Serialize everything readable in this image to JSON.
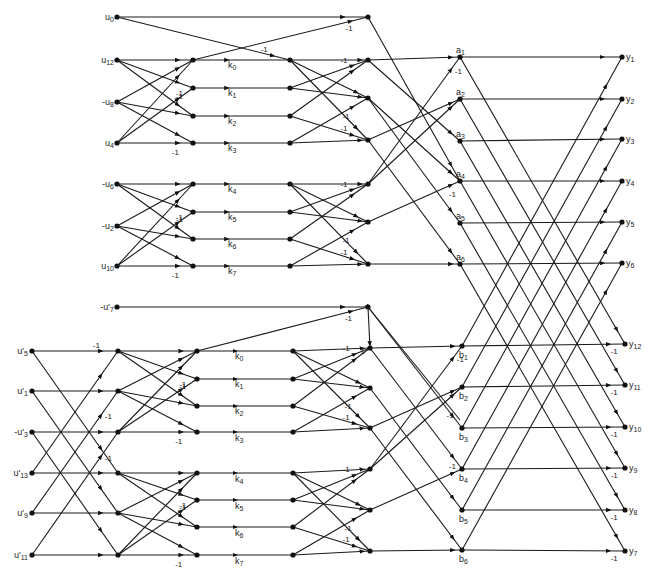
{
  "diagram": {
    "type": "signal-flow-graph",
    "top_inputs": [
      {
        "id": "u0",
        "label": "u",
        "sub": "0",
        "x": 117,
        "y": 17
      },
      {
        "id": "u12",
        "label": "u",
        "sub": "12",
        "x": 117,
        "y": 60
      },
      {
        "id": "mu8",
        "label": "-u",
        "sub": "8",
        "x": 117,
        "y": 102
      },
      {
        "id": "u4",
        "label": "u",
        "sub": "4",
        "x": 117,
        "y": 143
      },
      {
        "id": "mu6",
        "label": "-u",
        "sub": "6",
        "x": 117,
        "y": 184
      },
      {
        "id": "mu2",
        "label": "-u",
        "sub": "2",
        "x": 117,
        "y": 226
      },
      {
        "id": "u10",
        "label": "u",
        "sub": "10",
        "x": 117,
        "y": 266
      },
      {
        "id": "mu7p",
        "label": "-u'",
        "sub": "7",
        "x": 117,
        "y": 307
      }
    ],
    "bottom_inputs": [
      {
        "id": "u5p",
        "label": "u'",
        "sub": "5",
        "x": 32,
        "y": 351
      },
      {
        "id": "u1p",
        "label": "u'",
        "sub": "1",
        "x": 32,
        "y": 391
      },
      {
        "id": "mu3p",
        "label": "-u'",
        "sub": "3",
        "x": 32,
        "y": 432
      },
      {
        "id": "u13p",
        "label": "u'",
        "sub": "13",
        "x": 32,
        "y": 473
      },
      {
        "id": "u9p",
        "label": "u'",
        "sub": "9",
        "x": 32,
        "y": 513
      },
      {
        "id": "u11p",
        "label": "u'",
        "sub": "11",
        "x": 32,
        "y": 555
      }
    ],
    "k_labels_top": [
      {
        "text": "k",
        "sub": "0",
        "x": 228,
        "y": 68
      },
      {
        "text": "k",
        "sub": "1",
        "x": 228,
        "y": 96
      },
      {
        "text": "k",
        "sub": "2",
        "x": 228,
        "y": 124
      },
      {
        "text": "k",
        "sub": "3",
        "x": 228,
        "y": 151
      },
      {
        "text": "k",
        "sub": "4",
        "x": 228,
        "y": 192
      },
      {
        "text": "k",
        "sub": "5",
        "x": 228,
        "y": 220
      },
      {
        "text": "k",
        "sub": "6",
        "x": 228,
        "y": 247
      },
      {
        "text": "k",
        "sub": "7",
        "x": 228,
        "y": 274
      }
    ],
    "k_labels_bottom": [
      {
        "text": "k",
        "sub": "0",
        "x": 235,
        "y": 359
      },
      {
        "text": "k",
        "sub": "1",
        "x": 235,
        "y": 387
      },
      {
        "text": "k",
        "sub": "2",
        "x": 235,
        "y": 414
      },
      {
        "text": "k",
        "sub": "3",
        "x": 235,
        "y": 441
      },
      {
        "text": "k",
        "sub": "4",
        "x": 235,
        "y": 482
      },
      {
        "text": "k",
        "sub": "5",
        "x": 235,
        "y": 509
      },
      {
        "text": "k",
        "sub": "6",
        "x": 235,
        "y": 536
      },
      {
        "text": "k",
        "sub": "7",
        "x": 235,
        "y": 564
      }
    ],
    "a_nodes": [
      {
        "text": "a",
        "sub": "1",
        "x": 460,
        "y": 57
      },
      {
        "text": "a",
        "sub": "2",
        "x": 460,
        "y": 99
      },
      {
        "text": "a",
        "sub": "3",
        "x": 460,
        "y": 141
      },
      {
        "text": "a",
        "sub": "4",
        "x": 460,
        "y": 181
      },
      {
        "text": "a",
        "sub": "5",
        "x": 460,
        "y": 223
      },
      {
        "text": "a",
        "sub": "6",
        "x": 460,
        "y": 264
      }
    ],
    "b_nodes": [
      {
        "text": "b",
        "sub": "1",
        "x": 462,
        "y": 346
      },
      {
        "text": "b",
        "sub": "2",
        "x": 462,
        "y": 387
      },
      {
        "text": "b",
        "sub": "3",
        "x": 462,
        "y": 428
      },
      {
        "text": "b",
        "sub": "4",
        "x": 462,
        "y": 469
      },
      {
        "text": "b",
        "sub": "5",
        "x": 462,
        "y": 510
      },
      {
        "text": "b",
        "sub": "6",
        "x": 462,
        "y": 550
      }
    ],
    "outputs": [
      {
        "text": "y",
        "sub": "1",
        "x": 622,
        "y": 57
      },
      {
        "text": "y",
        "sub": "2",
        "x": 622,
        "y": 99
      },
      {
        "text": "y",
        "sub": "3",
        "x": 622,
        "y": 139
      },
      {
        "text": "y",
        "sub": "4",
        "x": 622,
        "y": 181
      },
      {
        "text": "y",
        "sub": "5",
        "x": 622,
        "y": 222
      },
      {
        "text": "y",
        "sub": "6",
        "x": 622,
        "y": 263
      },
      {
        "text": "y",
        "sub": "12",
        "x": 625,
        "y": 344
      },
      {
        "text": "y",
        "sub": "11",
        "x": 625,
        "y": 385
      },
      {
        "text": "y",
        "sub": "10",
        "x": 625,
        "y": 427
      },
      {
        "text": "y",
        "sub": "9",
        "x": 625,
        "y": 468
      },
      {
        "text": "y",
        "sub": "8",
        "x": 625,
        "y": 510
      },
      {
        "text": "y",
        "sub": "7",
        "x": 625,
        "y": 551
      }
    ],
    "weight_label": "-1"
  }
}
